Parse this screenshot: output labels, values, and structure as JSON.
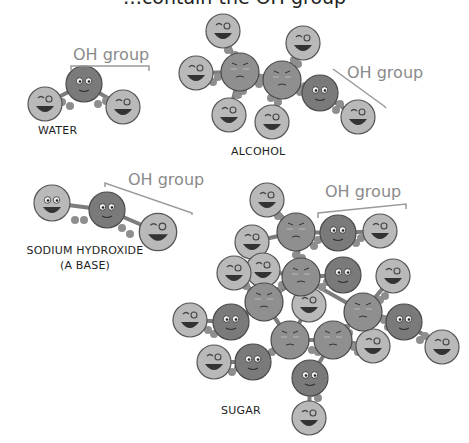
{
  "title": "…contain the OH group",
  "colors": {
    "background": "#ffffff",
    "light_atom": "#b9b9b9",
    "dark_atom": "#7a7a7a",
    "mid_atom": "#8f8f8f",
    "outline": "#555555",
    "bond": "#7d7d7d",
    "bracket": "#9a9a9a",
    "oh_label": "#8a8a8a",
    "label": "#1e1e1e"
  },
  "molecules": {
    "water": {
      "label": "WATER",
      "oh_label": "OH group"
    },
    "alcohol": {
      "label": "ALCOHOL",
      "oh_label": "OH group"
    },
    "sodium_hydroxide": {
      "label_line1": "SODIUM HYDROXIDE",
      "label_line2": "(A BASE)",
      "oh_label": "OH group"
    },
    "sugar": {
      "label": "SUGAR",
      "oh_label": "OH group"
    }
  }
}
